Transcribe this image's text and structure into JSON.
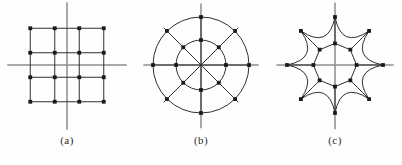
{
  "figure": {
    "background_color": "#fefefe",
    "axis_color": "#8d8d8d",
    "mesh_color": "#2f2f2f",
    "node_color": "#1a1a1a",
    "caption_color": "#2b2b2b",
    "panels": [
      {
        "id": "a",
        "caption": "(a)",
        "name": "cartesian-grid",
        "description": "rectangular cartesian mesh",
        "node_count": 16,
        "grid_rows": 4,
        "grid_cols": 4
      },
      {
        "id": "b",
        "caption": "(b)",
        "name": "polar-grid",
        "description": "polar mesh with two concentric circles and eight radial spokes",
        "node_count": 16,
        "ring_count": 2,
        "spoke_count": 8
      },
      {
        "id": "c",
        "caption": "(c)",
        "name": "star-warped-grid",
        "description": "eight pointed star mesh with concave arc edges",
        "node_count": 16,
        "ring_count": 2,
        "spoke_count": 8,
        "star_points": 8
      }
    ]
  },
  "chart_data": {
    "type": "scatter",
    "title": "",
    "xlabel": "",
    "ylabel": "",
    "grid": true,
    "legend": "none",
    "panels": [
      {
        "label": "(a)",
        "mesh_type": "cartesian",
        "xlim": [
          -1.0,
          1.0
        ],
        "ylim": [
          -1.0,
          1.0
        ],
        "x_nodes": [
          -0.75,
          -0.25,
          0.25,
          0.75
        ],
        "y_nodes": [
          0.75,
          0.25,
          -0.25,
          -0.75
        ],
        "points": [
          [
            -0.75,
            0.75
          ],
          [
            -0.25,
            0.75
          ],
          [
            0.25,
            0.75
          ],
          [
            0.75,
            0.75
          ],
          [
            -0.75,
            0.25
          ],
          [
            -0.25,
            0.25
          ],
          [
            0.25,
            0.25
          ],
          [
            0.75,
            0.25
          ],
          [
            -0.75,
            -0.25
          ],
          [
            -0.25,
            -0.25
          ],
          [
            0.25,
            -0.25
          ],
          [
            0.75,
            -0.25
          ],
          [
            -0.75,
            -0.75
          ],
          [
            -0.25,
            -0.75
          ],
          [
            0.25,
            -0.75
          ],
          [
            0.75,
            -0.75
          ]
        ],
        "axis_x_offset": 0.0,
        "axis_y_offset": 0.0
      },
      {
        "label": "(b)",
        "mesh_type": "polar",
        "xlim": [
          -1.15,
          1.15
        ],
        "ylim": [
          -1.15,
          1.15
        ],
        "radii": [
          0.52,
          1.0
        ],
        "angles_deg": [
          0,
          45,
          90,
          135,
          180,
          225,
          270,
          315
        ],
        "points": [
          [
            0.52,
            0
          ],
          [
            0.37,
            0.37
          ],
          [
            0,
            0.52
          ],
          [
            -0.37,
            0.37
          ],
          [
            -0.52,
            0
          ],
          [
            -0.37,
            -0.37
          ],
          [
            0,
            -0.52
          ],
          [
            0.37,
            -0.37
          ],
          [
            1.0,
            0
          ],
          [
            0.71,
            0.71
          ],
          [
            0,
            1.0
          ],
          [
            -0.71,
            0.71
          ],
          [
            -1.0,
            0
          ],
          [
            -0.71,
            -0.71
          ],
          [
            0,
            -1.0
          ],
          [
            0.71,
            -0.71
          ]
        ]
      },
      {
        "label": "(c)",
        "mesh_type": "star",
        "xlim": [
          -1.15,
          1.15
        ],
        "ylim": [
          -1.15,
          1.15
        ],
        "radii": [
          0.45,
          1.0
        ],
        "angles_deg": [
          0,
          45,
          90,
          135,
          180,
          225,
          270,
          315
        ],
        "arc_bow": -0.34,
        "points": [
          [
            0.45,
            0
          ],
          [
            0.32,
            0.32
          ],
          [
            0,
            0.45
          ],
          [
            -0.32,
            0.32
          ],
          [
            -0.45,
            0
          ],
          [
            -0.32,
            -0.32
          ],
          [
            0,
            -0.45
          ],
          [
            0.32,
            -0.32
          ],
          [
            1.0,
            0
          ],
          [
            0.71,
            0.71
          ],
          [
            0,
            1.0
          ],
          [
            -0.71,
            0.71
          ],
          [
            -1.0,
            0
          ],
          [
            -0.71,
            -0.71
          ],
          [
            0,
            -1.0
          ],
          [
            0.71,
            -0.71
          ]
        ]
      }
    ]
  }
}
